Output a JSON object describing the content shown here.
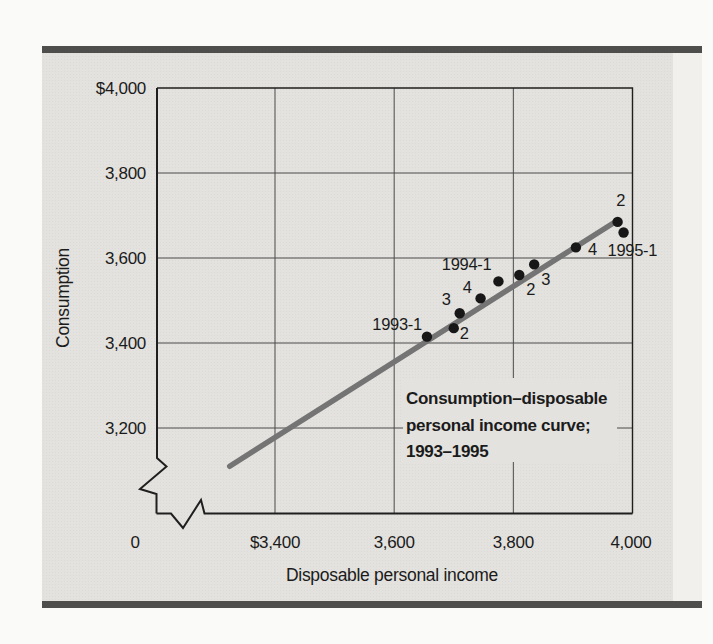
{
  "chart_data": {
    "type": "scatter",
    "xlabel": "Disposable personal income",
    "ylabel": "Consumption",
    "annotation": {
      "lines": [
        "Consumption–disposable",
        "personal income curve;",
        "1993–1995"
      ]
    },
    "x_axis": {
      "origin_label": "0",
      "broken_at_origin": true,
      "range_shown": [
        3400,
        4000
      ],
      "ticks": [
        {
          "value": 3400,
          "label": "$3,400"
        },
        {
          "value": 3600,
          "label": "3,600"
        },
        {
          "value": 3800,
          "label": "3,800"
        },
        {
          "value": 4000,
          "label": "4,000"
        }
      ]
    },
    "y_axis": {
      "broken_at_origin": true,
      "range_shown": [
        3200,
        4000
      ],
      "ticks": [
        {
          "value": 4000,
          "label": "$4,000"
        },
        {
          "value": 3800,
          "label": "3,800"
        },
        {
          "value": 3600,
          "label": "3,600"
        },
        {
          "value": 3400,
          "label": "3,400"
        },
        {
          "value": 3200,
          "label": "3,200"
        }
      ]
    },
    "points": [
      {
        "id": "1993-1",
        "label": "1993-1",
        "x": 3655,
        "y": 3415,
        "anchor": "end",
        "dx": -5,
        "dy": -7
      },
      {
        "id": "1993-2",
        "label": "2",
        "x": 3700,
        "y": 3435,
        "anchor": "start",
        "dx": 6,
        "dy": 11
      },
      {
        "id": "1993-3",
        "label": "3",
        "x": 3710,
        "y": 3470,
        "anchor": "end",
        "dx": -9,
        "dy": -8
      },
      {
        "id": "1993-4",
        "label": "4",
        "x": 3745,
        "y": 3505,
        "anchor": "end",
        "dx": -9,
        "dy": -5
      },
      {
        "id": "1994-1",
        "label": "1994-1",
        "x": 3775,
        "y": 3545,
        "anchor": "end",
        "dx": -7,
        "dy": -11
      },
      {
        "id": "1994-2",
        "label": "2",
        "x": 3810,
        "y": 3560,
        "anchor": "start",
        "dx": 7,
        "dy": 20
      },
      {
        "id": "1994-3",
        "label": "3",
        "x": 3835,
        "y": 3585,
        "anchor": "start",
        "dx": 7,
        "dy": 21
      },
      {
        "id": "1994-4",
        "label": "4",
        "x": 3905,
        "y": 3625,
        "anchor": "start",
        "dx": 12,
        "dy": 8
      },
      {
        "id": "1995-1",
        "label": "1995-1",
        "x": 3985,
        "y": 3660,
        "anchor": "start",
        "dx": -16,
        "dy": 23
      },
      {
        "id": "1995-2",
        "label": "2",
        "x": 3975,
        "y": 3685,
        "anchor": "middle",
        "dx": 3,
        "dy": -16
      }
    ],
    "trend_line": {
      "x1": 3324,
      "y1": 3110,
      "x2": 3972,
      "y2": 3686
    }
  },
  "colors": {
    "page": "#fafaf8",
    "panel": "#e3e2de",
    "side_strip": "#f1f0ec",
    "rule": "#4e4e4c",
    "axis": "#1f1f1f",
    "grid": "#4a4a4a",
    "trend_line": "#747474",
    "point": "#171717",
    "text": "#1b1b1b"
  }
}
